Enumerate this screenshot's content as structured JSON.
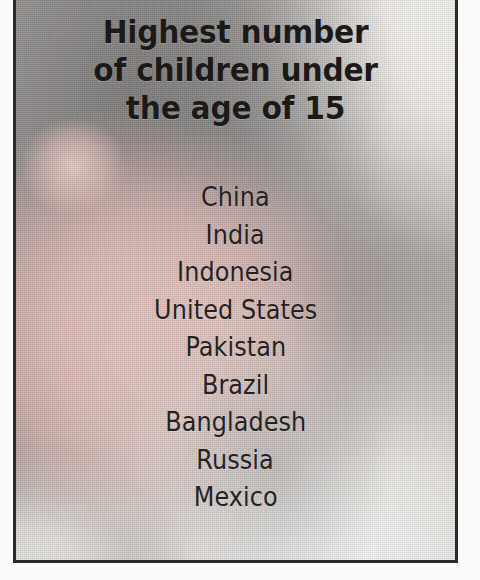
{
  "clipping": {
    "headline": {
      "lines": [
        "Highest number",
        "of children under",
        "the age of 15"
      ],
      "full_text": "Highest number of children under the age of 15"
    },
    "countries": [
      {
        "rank": 1,
        "name": "China"
      },
      {
        "rank": 2,
        "name": "India"
      },
      {
        "rank": 3,
        "name": "Indonesia"
      },
      {
        "rank": 4,
        "name": "United States"
      },
      {
        "rank": 5,
        "name": "Pakistan"
      },
      {
        "rank": 6,
        "name": "Brazil"
      },
      {
        "rank": 7,
        "name": "Bangladesh"
      },
      {
        "rank": 8,
        "name": "Russia"
      },
      {
        "rank": 9,
        "name": "Mexico"
      }
    ],
    "colors": {
      "frame_border": "#2c2a28",
      "headline_text": "#1c1a19",
      "list_text": "#24211f",
      "photo_gray": "#9b9a98",
      "photo_skin": "#e5c2bb",
      "photo_highlight": "#faf9f7",
      "page_background": "#ffffff"
    },
    "background_photo": {
      "subject": "infant-face-photo",
      "description": "grainy black-and-white newsprint photograph of a baby's head and shoulders on a white blanket"
    }
  }
}
